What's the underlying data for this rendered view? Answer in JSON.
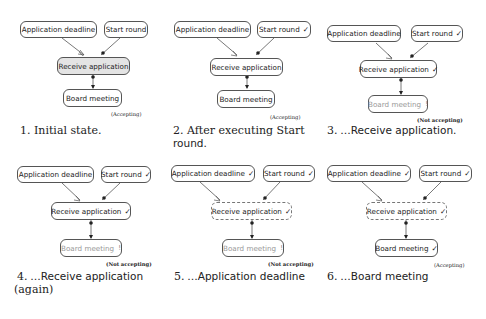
{
  "nodes": {
    "deadline": "Application deadline",
    "start": "Start round",
    "receive": "Receive application",
    "board": "Board meeting"
  },
  "marks": {
    "check": "✓",
    "bang": "!"
  },
  "status": {
    "accepting": "(Accepting)",
    "not_accepting": "(Not accepting)"
  },
  "panels": [
    {
      "caption_num": "1.",
      "caption": "Initial state.",
      "status": "(Accepting)"
    },
    {
      "caption_num": "2.",
      "caption": "After executing Start",
      "caption_line2": "round.",
      "status": "(Accepting)"
    },
    {
      "caption_num": "3.",
      "caption": "…Receive application.",
      "status": "(Not accepting)"
    },
    {
      "caption_num": "4.",
      "caption": "…Receive application",
      "caption_line2": "(again)",
      "status": "(Not accepting)"
    },
    {
      "caption_num": "5.",
      "caption": "…Application deadline",
      "status": "(Not accepting)"
    },
    {
      "caption_num": "6.",
      "caption": "…Board meeting",
      "status": "(Accepting)"
    }
  ]
}
